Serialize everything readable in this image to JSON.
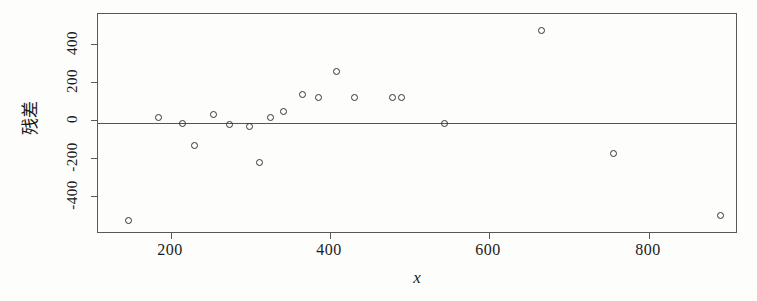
{
  "chart_data": {
    "type": "scatter",
    "title": "",
    "xlabel": "x",
    "ylabel": "残差",
    "xlim": [
      140,
      900
    ],
    "ylim": [
      -600,
      600
    ],
    "xticks": [
      200,
      400,
      600,
      800
    ],
    "yticks": [
      400,
      200,
      0,
      -200,
      -400
    ],
    "grid": false,
    "legend": null,
    "reference_line": {
      "orientation": "horizontal",
      "value": 0
    },
    "marker": {
      "shape": "open-circle",
      "color": "#33332f",
      "size": 7
    },
    "series": [
      {
        "name": "residuals",
        "points": [
          {
            "x": 176,
            "y": -535
          },
          {
            "x": 212,
            "y": 32
          },
          {
            "x": 241,
            "y": 0
          },
          {
            "x": 255,
            "y": -122
          },
          {
            "x": 277,
            "y": 48
          },
          {
            "x": 297,
            "y": -11
          },
          {
            "x": 321,
            "y": -21
          },
          {
            "x": 332,
            "y": -216
          },
          {
            "x": 345,
            "y": 32
          },
          {
            "x": 361,
            "y": 64
          },
          {
            "x": 384,
            "y": 159
          },
          {
            "x": 403,
            "y": 143
          },
          {
            "x": 424,
            "y": 286
          },
          {
            "x": 446,
            "y": 143
          },
          {
            "x": 491,
            "y": 143
          },
          {
            "x": 501,
            "y": 138
          },
          {
            "x": 553,
            "y": 0
          },
          {
            "x": 668,
            "y": 508
          },
          {
            "x": 754,
            "y": -169
          },
          {
            "x": 882,
            "y": -508
          }
        ]
      }
    ]
  },
  "axes": {
    "y_tick_labels": [
      "400",
      "200",
      "0",
      "-200",
      "-400"
    ],
    "x_tick_labels": [
      "200",
      "400",
      "600",
      "800"
    ],
    "x_title": "x",
    "y_title": "残差"
  },
  "colors": {
    "axis": "#5a5a55",
    "marker": "#33332f",
    "background": "#fdfdfb",
    "text": "#1a1a1a"
  }
}
